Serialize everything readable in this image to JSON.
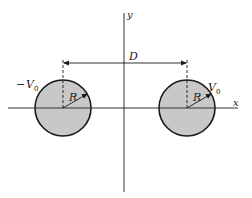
{
  "diagram": {
    "axes": {
      "x_label": "x",
      "y_label": "y"
    },
    "separation": {
      "label": "D"
    },
    "cylinders": [
      {
        "name": "left-cylinder",
        "radius_label": "R",
        "potential_sign": "−",
        "potential_symbol": "V",
        "potential_subscript": "0"
      },
      {
        "name": "right-cylinder",
        "radius_label": "R",
        "potential_sign": "",
        "potential_symbol": "V",
        "potential_subscript": "0"
      }
    ],
    "colors": {
      "fill": "#c8c8c8",
      "stroke": "#1a1a1a",
      "axis": "#333333"
    }
  }
}
